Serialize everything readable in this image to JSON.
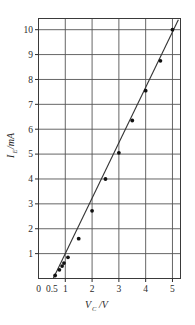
{
  "chart_data": {
    "type": "scatter",
    "title": "",
    "subtitle": "",
    "xlabel": "V",
    "xlabel_sub": "C",
    "xlabel_unit": "/V",
    "xlabel_full": "V_C /V",
    "ylabel": "I",
    "ylabel_sub": "E",
    "ylabel_unit": "/mA",
    "ylabel_full": "I_E /mA",
    "xlim": [
      0,
      5.3
    ],
    "ylim": [
      0,
      10.45
    ],
    "grid": true,
    "legend": false,
    "x_ticks": [
      0,
      0.5,
      1,
      2,
      3,
      4,
      5
    ],
    "x_tick_labels": [
      "0",
      "0.5",
      "1",
      "2",
      "3",
      "4",
      "5"
    ],
    "x_gridlines": [
      1,
      2,
      3,
      4,
      5
    ],
    "y_ticks": [
      1,
      2,
      3,
      4,
      5,
      6,
      7,
      8,
      9,
      10
    ],
    "y_tick_labels": [
      "1",
      "2",
      "3",
      "4",
      "5",
      "6",
      "7",
      "8",
      "9",
      "10"
    ],
    "y_gridlines": [
      1,
      2,
      3,
      4,
      5,
      6,
      7,
      8,
      9,
      10
    ],
    "series": [
      {
        "name": "I-V characteristic",
        "marker": "filled-circle",
        "line": "solid",
        "x": [
          0.62,
          0.78,
          0.88,
          0.95,
          1.1,
          1.5,
          2.0,
          2.5,
          3.0,
          3.5,
          4.0,
          4.55,
          5.0
        ],
        "y": [
          0.12,
          0.35,
          0.5,
          0.62,
          0.85,
          1.6,
          2.72,
          4.0,
          5.05,
          6.35,
          7.55,
          8.75,
          10.0
        ]
      }
    ],
    "line_start": {
      "x": 0.55,
      "y": 0.0
    },
    "line_end": {
      "x": 5.22,
      "y": 10.4
    },
    "colors": {
      "axis": "#2b2b2b",
      "grid": "#555555",
      "marker": "#111111",
      "line": "#333333",
      "background": "#ffffff"
    }
  }
}
